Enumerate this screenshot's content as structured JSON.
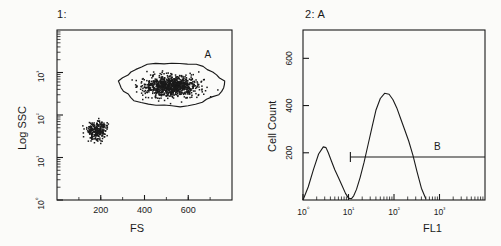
{
  "figure": {
    "background": "#fbfbf9",
    "ink": "#1a1a1a"
  },
  "panels": {
    "scatter": {
      "title": "1:"
    },
    "histogram": {
      "title": "2:  A"
    }
  },
  "chart_data": [
    {
      "type": "scatter",
      "title": "1:",
      "xlabel": "FS",
      "ylabel": "Log SSC",
      "xlim": [
        0,
        800
      ],
      "ylim": [
        1,
        10000
      ],
      "yscale": "log",
      "xscale": "linear",
      "xticks": [
        200,
        400,
        600
      ],
      "xticklabels": [
        "200",
        "400",
        "600"
      ],
      "yticks": [
        1,
        10,
        100,
        1000
      ],
      "yticklabels": [
        "10⁰",
        "10¹",
        "10²",
        "10³"
      ],
      "grid": false,
      "legend": "none",
      "annotations": [
        {
          "text": "A",
          "x": 690,
          "y": 2200,
          "note": "gate-label"
        }
      ],
      "gates": [
        {
          "name": "A",
          "shape": "polygon-closed",
          "note": "hand-drawn oval enclosing high FS / high SSC population"
        }
      ],
      "clusters": [
        {
          "name": "low-scatter-population",
          "center_x": 178,
          "center_y": 45,
          "spread_x": 38,
          "spread_y_log": 0.18,
          "n_points": 260,
          "inside_gate": "none"
        },
        {
          "name": "gated-population-A",
          "center_x": 520,
          "center_y": 500,
          "spread_x": 105,
          "spread_y_log": 0.22,
          "n_points": 900,
          "inside_gate": "A"
        }
      ]
    },
    {
      "type": "line",
      "title": "2:  A",
      "xlabel": "FL1",
      "ylabel": "Cell Count",
      "xlim": [
        1,
        10000
      ],
      "ylim": [
        0,
        720
      ],
      "xscale": "log",
      "yscale": "linear",
      "xticks": [
        1,
        10,
        100,
        1000
      ],
      "xticklabels": [
        "10⁰",
        "10¹",
        "10²",
        "10³"
      ],
      "yticks": [
        200,
        400,
        600
      ],
      "yticklabels": [
        "200",
        "400",
        "600"
      ],
      "grid": false,
      "legend": "none",
      "series": [
        {
          "name": "cell-count-histogram",
          "x": [
            1.0,
            1.3,
            1.7,
            2.2,
            2.8,
            3.2,
            3.6,
            4.2,
            5.0,
            6.0,
            7.2,
            8.6,
            10.0,
            11.5,
            13.0,
            15.0,
            18.0,
            22.0,
            27.0,
            33.0,
            40.0,
            50.0,
            62.0,
            78.0,
            95.0,
            115.0,
            140.0,
            170.0,
            210.0,
            260.0,
            320.0,
            400.0,
            500.0
          ],
          "y": [
            0,
            55,
            130,
            195,
            225,
            222,
            200,
            165,
            128,
            95,
            62,
            28,
            8,
            5,
            18,
            45,
            95,
            160,
            235,
            310,
            380,
            430,
            452,
            448,
            425,
            390,
            345,
            300,
            250,
            190,
            120,
            50,
            5
          ]
        }
      ],
      "annotations": [
        {
          "text": "B",
          "x": 900,
          "y": 210,
          "note": "gate-label"
        }
      ],
      "gates": [
        {
          "name": "B",
          "shape": "horizontal-marker",
          "y": 182,
          "x_start": 11,
          "x_end": 10000,
          "note": "region marker bar with left end tick, starting just above 10¹"
        }
      ]
    }
  ]
}
